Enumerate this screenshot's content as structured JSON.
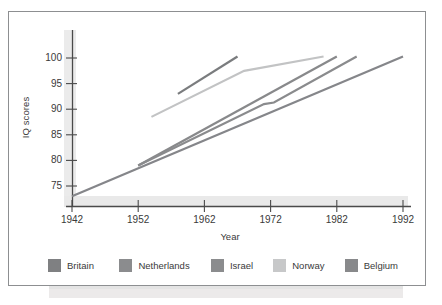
{
  "chart_data": {
    "type": "line",
    "title": "",
    "xlabel": "Year",
    "ylabel": "IQ scores",
    "xlim": [
      1942,
      1994
    ],
    "ylim": [
      71,
      102
    ],
    "grid": false,
    "legend_position": "bottom",
    "xticks": [
      "1942",
      "1952",
      "1962",
      "1972",
      "1982",
      "1992"
    ],
    "xtick_values": [
      1942,
      1952,
      1962,
      1972,
      1982,
      1992
    ],
    "yticks": [
      "75",
      "80",
      "85",
      "90",
      "95",
      "100"
    ],
    "ytick_values": [
      75,
      80,
      85,
      90,
      95,
      100
    ],
    "series": [
      {
        "name": "Britain",
        "color": "#7a7c7e",
        "x": [
          1958,
          1967
        ],
        "values": [
          93.0,
          100.3
        ]
      },
      {
        "name": "Netherlands",
        "color": "#88898b",
        "x": [
          1952,
          1982
        ],
        "values": [
          79.0,
          100.3
        ]
      },
      {
        "name": "Israel",
        "color": "#8a8b8d",
        "x": [
          1952,
          1971,
          1972.5,
          1985
        ],
        "values": [
          79.0,
          91.0,
          91.3,
          100.3
        ]
      },
      {
        "name": "Norway",
        "color": "#c2c3c4",
        "x": [
          1954,
          1968,
          1980
        ],
        "values": [
          88.5,
          97.5,
          100.3
        ]
      },
      {
        "name": "Belgium",
        "color": "#85868a",
        "x": [
          1942,
          1992
        ],
        "values": [
          73.0,
          100.3
        ]
      }
    ]
  },
  "legend": {
    "items": [
      {
        "label": "Britain",
        "color": "#7f8082"
      },
      {
        "label": "Netherlands",
        "color": "#8b8c8e"
      },
      {
        "label": "Israel",
        "color": "#8b8c8e"
      },
      {
        "label": "Norway",
        "color": "#c7c8c9"
      },
      {
        "label": "Belgium",
        "color": "#88898b"
      }
    ]
  },
  "axes": {
    "y_axis_label": "IQ scores",
    "x_axis_label": "Year"
  }
}
